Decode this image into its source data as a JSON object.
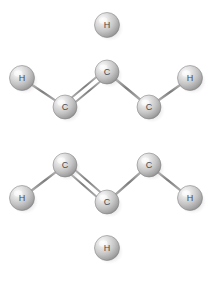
{
  "figure": {
    "molecule_name": "Benzene",
    "molecular_formula": "C6H6",
    "background_color": "#ffffff",
    "atom_fill_light": "#f2f2f2",
    "atom_fill_mid": "#c8c8c8",
    "atom_fill_dark": "#8f8f8f",
    "atom_stroke_color": "#7a7a7a",
    "bond_color": "#8a8a8a",
    "label_color": "#4a4a4a",
    "shadow_color": "#9a9a9a",
    "divider_color": "#6f6f6f"
  },
  "atoms": [
    {
      "id": "h-top",
      "element": "H",
      "label": "H",
      "cx": 107,
      "cy": 25,
      "r": 12.5
    },
    {
      "id": "c-top",
      "element": "C",
      "label": "C",
      "cx": 107,
      "cy": 72,
      "r": 12.0
    },
    {
      "id": "h-upper-left",
      "element": "H",
      "label": "H",
      "cx": 22,
      "cy": 78,
      "r": 12.5
    },
    {
      "id": "c-upper-left",
      "element": "C",
      "label": "C",
      "cx": 65,
      "cy": 107,
      "r": 12.0
    },
    {
      "id": "h-upper-right",
      "element": "H",
      "label": "H",
      "cx": 190,
      "cy": 78,
      "r": 12.5
    },
    {
      "id": "c-upper-right",
      "element": "C",
      "label": "C",
      "cx": 149,
      "cy": 107,
      "r": 12.0
    },
    {
      "id": "c-lower-left",
      "element": "C",
      "label": "C",
      "cx": 65,
      "cy": 165,
      "r": 12.0
    },
    {
      "id": "h-lower-left",
      "element": "H",
      "label": "H",
      "cx": 22,
      "cy": 198,
      "r": 12.5
    },
    {
      "id": "c-lower-right",
      "element": "C",
      "label": "C",
      "cx": 149,
      "cy": 165,
      "r": 12.0
    },
    {
      "id": "h-lower-right",
      "element": "H",
      "label": "H",
      "cx": 190,
      "cy": 198,
      "r": 12.5
    },
    {
      "id": "c-bottom",
      "element": "C",
      "label": "C",
      "cx": 107,
      "cy": 202,
      "r": 12.0
    },
    {
      "id": "h-bottom",
      "element": "H",
      "label": "H",
      "cx": 107,
      "cy": 248,
      "r": 12.5
    }
  ],
  "bonds": [
    {
      "id": "bond-c-top--c-upper-left",
      "from": "c-top",
      "to": "c-upper-left",
      "order": 2
    },
    {
      "id": "bond-c-top--c-upper-right",
      "from": "c-top",
      "to": "c-upper-right",
      "order": 1
    },
    {
      "id": "bond-c-upper-left--c-lower-left",
      "from": "c-upper-left",
      "to": "c-lower-left",
      "order": 1
    },
    {
      "id": "bond-c-upper-right--c-lower-right",
      "from": "c-upper-right",
      "to": "c-lower-right",
      "order": 2
    },
    {
      "id": "bond-c-lower-left--c-bottom",
      "from": "c-lower-left",
      "to": "c-bottom",
      "order": 2
    },
    {
      "id": "bond-c-lower-right--c-bottom",
      "from": "c-lower-right",
      "to": "c-bottom",
      "order": 1
    },
    {
      "id": "bond-c-top--h-top",
      "from": "c-top",
      "to": "h-top",
      "order": 1
    },
    {
      "id": "bond-c-upper-left--h-upper-left",
      "from": "c-upper-left",
      "to": "h-upper-left",
      "order": 1
    },
    {
      "id": "bond-c-upper-right--h-upper-right",
      "from": "c-upper-right",
      "to": "h-upper-right",
      "order": 1
    },
    {
      "id": "bond-c-lower-left--h-lower-left",
      "from": "c-lower-left",
      "to": "h-lower-left",
      "order": 1
    },
    {
      "id": "bond-c-lower-right--h-lower-right",
      "from": "c-lower-right",
      "to": "h-lower-right",
      "order": 1
    },
    {
      "id": "bond-c-bottom--h-bottom",
      "from": "c-bottom",
      "to": "h-bottom",
      "order": 1
    }
  ],
  "divider": {
    "id": "bottom-divider",
    "x1": 10,
    "x2": 205,
    "y": 273
  }
}
